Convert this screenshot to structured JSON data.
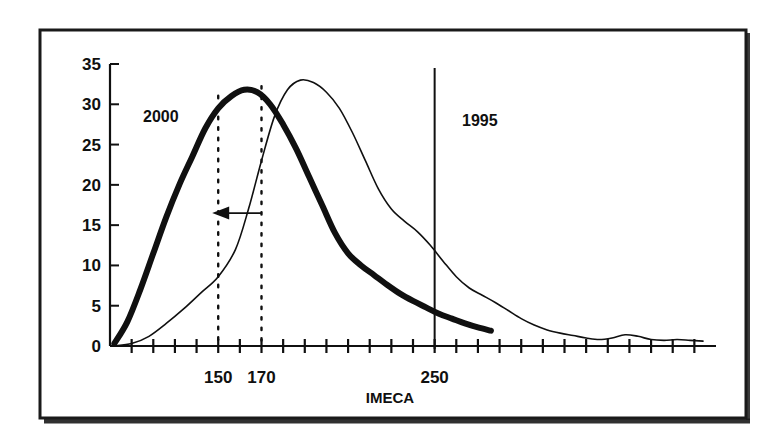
{
  "figure": {
    "frame_color": "#1a1a1a",
    "background": "#ffffff",
    "ink_color": "#101010"
  },
  "chart_data": {
    "type": "line",
    "title": "",
    "subtitle": "",
    "xlabel": "IMECA",
    "ylabel": "",
    "xlim": [
      100,
      380
    ],
    "ylim": [
      0,
      35
    ],
    "grid": false,
    "legend_position": "inline-annotations",
    "yticks": [
      0,
      5,
      10,
      15,
      20,
      25,
      30,
      35
    ],
    "ytick_labels": [
      "0",
      "5",
      "10",
      "15",
      "20",
      "25",
      "30",
      "35"
    ],
    "xticks": [
      110,
      120,
      130,
      140,
      150,
      160,
      170,
      180,
      190,
      200,
      210,
      220,
      230,
      240,
      250,
      260,
      270,
      280,
      290,
      300,
      310,
      320,
      330,
      340,
      350,
      360,
      370
    ],
    "xtick_labeled": [
      150,
      170,
      250
    ],
    "xtick_labels": [
      "150",
      "170",
      "250"
    ],
    "series": [
      {
        "name": "2000",
        "label": "2000",
        "style": "thick",
        "linewidth": 6,
        "color": "#101010",
        "x": [
          102,
          108,
          114,
          120,
          126,
          132,
          138,
          144,
          150,
          156,
          162,
          168,
          174,
          180,
          186,
          192,
          198,
          204,
          210,
          216,
          222,
          228,
          234,
          240,
          246,
          252,
          258,
          264,
          270,
          276
        ],
        "y": [
          0.3,
          3.0,
          7.0,
          11.5,
          16.0,
          20.0,
          23.5,
          27.0,
          29.5,
          31.0,
          31.8,
          31.5,
          30.0,
          27.5,
          24.5,
          21.0,
          17.5,
          14.0,
          11.5,
          10.0,
          8.8,
          7.6,
          6.5,
          5.6,
          4.8,
          4.0,
          3.4,
          2.8,
          2.3,
          1.9
        ]
      },
      {
        "name": "1995",
        "label": "1995",
        "style": "thin",
        "linewidth": 1.6,
        "color": "#101010",
        "x": [
          102,
          110,
          118,
          126,
          134,
          142,
          150,
          158,
          164,
          170,
          176,
          182,
          188,
          194,
          200,
          206,
          212,
          218,
          224,
          230,
          236,
          242,
          248,
          254,
          260,
          266,
          272,
          278,
          284,
          290,
          296,
          302,
          308,
          314,
          320,
          326,
          332,
          338,
          344,
          350,
          356,
          362,
          368,
          374
        ],
        "y": [
          0.0,
          0.3,
          1.2,
          2.8,
          4.6,
          6.6,
          8.6,
          12.0,
          17.0,
          23.0,
          28.5,
          31.8,
          33.0,
          32.7,
          31.5,
          29.5,
          26.5,
          23.0,
          19.5,
          17.0,
          15.5,
          14.2,
          12.5,
          10.5,
          8.6,
          7.2,
          6.3,
          5.4,
          4.4,
          3.4,
          2.6,
          2.0,
          1.6,
          1.3,
          1.0,
          0.8,
          1.0,
          1.4,
          1.2,
          0.8,
          0.7,
          0.8,
          0.7,
          0.6
        ]
      }
    ],
    "reference_lines": [
      {
        "name": "dotted-150",
        "x": 150,
        "style": "dotted",
        "extent": "peak"
      },
      {
        "name": "dotted-170",
        "x": 170,
        "style": "dotted",
        "extent": "peak"
      },
      {
        "name": "threshold-250",
        "x": 250,
        "style": "solid",
        "extent": "full"
      }
    ],
    "annotations": [
      {
        "name": "shift-arrow",
        "type": "arrow",
        "from_x": 170,
        "to_x": 150,
        "y": 16.5,
        "direction": "left"
      },
      {
        "name": "series-label-2000",
        "type": "text",
        "text": "2000",
        "x": 122,
        "y": 27.0
      },
      {
        "name": "series-label-1995",
        "type": "text",
        "text": "1995",
        "x": 205,
        "y": 26.5
      }
    ]
  },
  "labels": {
    "x_axis_name": "IMECA",
    "y_ticks": [
      "0",
      "5",
      "10",
      "15",
      "20",
      "25",
      "30",
      "35"
    ],
    "x_ticks": [
      "150",
      "170",
      "250"
    ],
    "series_2000": "2000",
    "series_1995": "1995"
  }
}
